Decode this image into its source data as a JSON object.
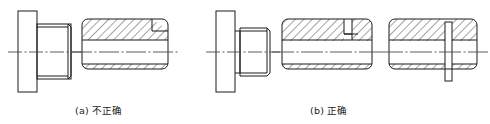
{
  "figure": {
    "background_color": "#ffffff",
    "line_color": "#1a1a1a",
    "hatch_color": "#1a1a1a",
    "centerline_color": "#4a4a4a",
    "captions": [
      {
        "id": "a",
        "label": "(a) 不正确",
        "meaning": "incorrect"
      },
      {
        "id": "b",
        "label": "(b) 正确",
        "meaning": "correct"
      }
    ],
    "views": [
      {
        "group": "a",
        "name": "plug-elevation-incorrect",
        "kind": "external-elevation",
        "description": "Flange plus plain cylindrical body, no chamfer detail"
      },
      {
        "group": "a",
        "name": "bushing-section-incorrect",
        "kind": "full-section",
        "description": "Sectioned sleeve with hatching above and below bore, single chamfer line top right"
      },
      {
        "group": "b",
        "name": "plug-elevation-correct",
        "kind": "external-elevation",
        "description": "Flange, neck and chamfered cylindrical body"
      },
      {
        "group": "b",
        "name": "bushing-section-correct",
        "kind": "full-section",
        "description": "Sectioned sleeve with hatching and recessed groove shown at top right"
      },
      {
        "group": "b",
        "name": "bushing-section-slot",
        "kind": "full-section",
        "description": "Sectioned sleeve with through slot drawn across the bore"
      }
    ]
  }
}
